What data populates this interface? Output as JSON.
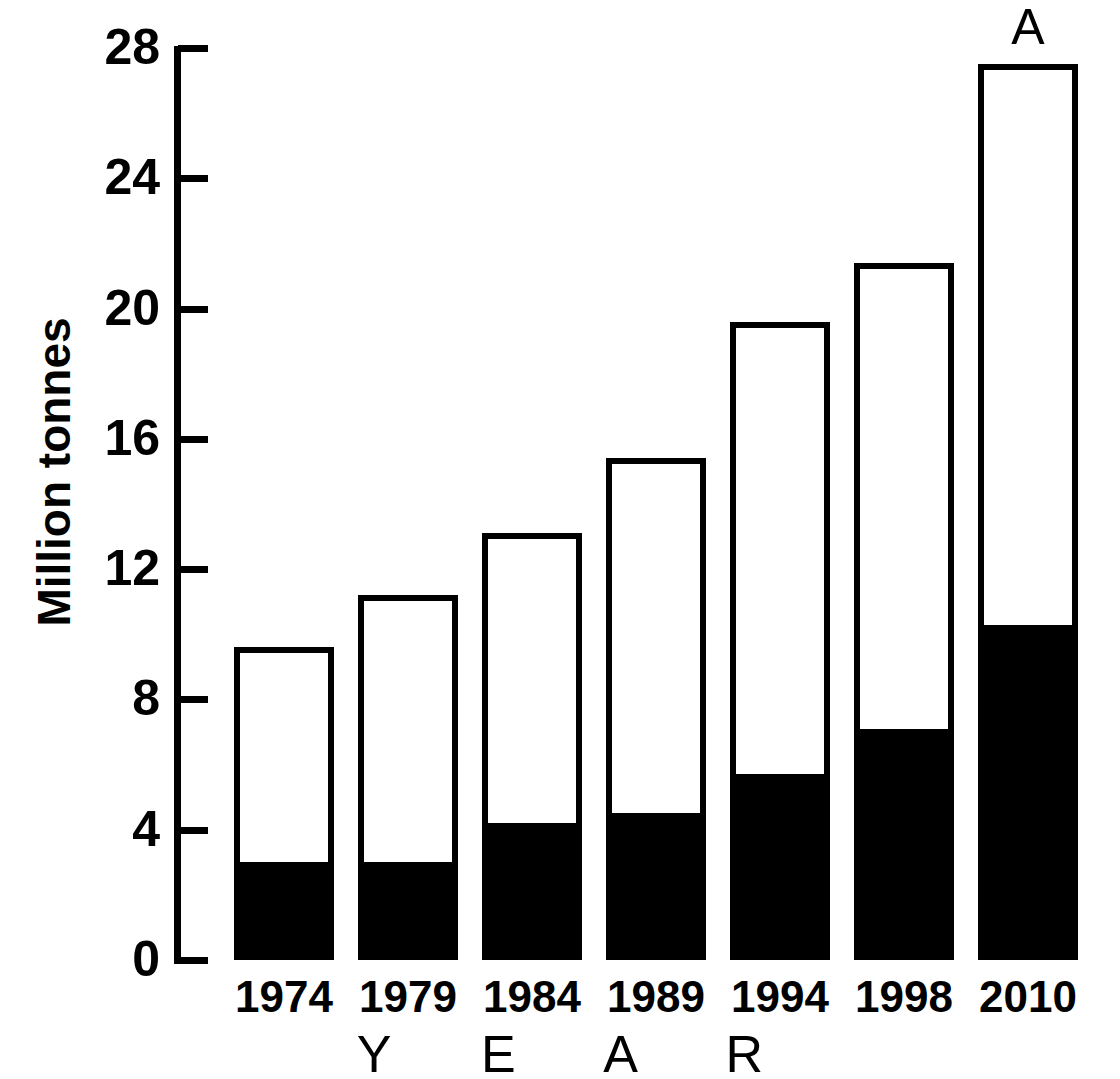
{
  "chart_data": {
    "type": "bar",
    "stacked": true,
    "title": "",
    "xlabel": "Y E A R",
    "ylabel": "Million tonnes",
    "categories": [
      "1974",
      "1979",
      "1984",
      "1989",
      "1994",
      "1998",
      "2010"
    ],
    "series": [
      {
        "name": "lower-segment",
        "fill": "#000000",
        "values": [
          3.0,
          3.0,
          4.2,
          4.5,
          5.7,
          7.1,
          10.3
        ]
      },
      {
        "name": "upper-segment",
        "fill": "#ffffff",
        "values": [
          6.6,
          8.2,
          8.9,
          10.9,
          13.9,
          14.3,
          17.2
        ]
      }
    ],
    "totals": [
      9.6,
      11.2,
      13.1,
      15.4,
      19.6,
      21.4,
      27.5
    ],
    "ylim": [
      0,
      28
    ],
    "yticks": [
      "0",
      "4",
      "8",
      "12",
      "16",
      "20",
      "24",
      "28"
    ],
    "ytick_values": [
      0,
      4,
      8,
      12,
      16,
      20,
      24,
      28
    ],
    "grid": false,
    "legend": "none",
    "annotations": [
      {
        "text": "A",
        "category": "2010",
        "position": "above-bar"
      }
    ],
    "colors": {
      "axis": "#000000",
      "bar_outline": "#000000",
      "bar_fill_lower": "#000000",
      "bar_fill_upper": "#ffffff",
      "background": "#ffffff"
    }
  }
}
